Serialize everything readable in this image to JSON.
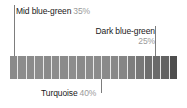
{
  "figure": {
    "type": "color-swatch-strip",
    "background_color": "#ffffff"
  },
  "callouts": [
    {
      "id": "mid-blue-green",
      "name": "Mid blue-green",
      "percent": "35%",
      "position": "top-left",
      "leader_target_x": 14,
      "label_color": "#1a1a1a",
      "percent_color": "#9a9a9a"
    },
    {
      "id": "dark-blue-green",
      "name": "Dark blue-green",
      "percent": "25%",
      "position": "top-right",
      "leader_target_x": 155,
      "label_color": "#1a1a1a",
      "percent_color": "#9a9a9a"
    },
    {
      "id": "turquoise",
      "name": "Turquoise",
      "percent": "40%",
      "position": "bottom-center",
      "leader_target_x": 101,
      "label_color": "#1a1a1a",
      "percent_color": "#9a9a9a"
    }
  ],
  "strip": {
    "segment_count": 20,
    "segment_colors": [
      "#8a8a8a",
      "#8c8c8c",
      "#8b8b8b",
      "#8d8d8d",
      "#8a8a8a",
      "#8c8c8c",
      "#8b8b8b",
      "#8d8d8d",
      "#8a8a8a",
      "#8c8c8c",
      "#8b8b8b",
      "#8a8a8a",
      "#888888",
      "#868686",
      "#7e7e7e",
      "#787878",
      "#6e6e6e",
      "#6a6a6a",
      "#636363",
      "#4e4e4e"
    ],
    "separator_color": "#e8e8e8",
    "leader_line_color": "#7d7d7d"
  },
  "chart_data": {
    "type": "bar",
    "title": "",
    "xlabel": "",
    "ylabel": "",
    "categories": [
      "Mid blue-green",
      "Turquoise",
      "Dark blue-green"
    ],
    "values": [
      35,
      40,
      25
    ],
    "value_labels": [
      "35%",
      "40%",
      "25%"
    ],
    "legend": "none",
    "grid": false,
    "note": "Proportional color-mix strip; three annotated components totalling 100%."
  }
}
